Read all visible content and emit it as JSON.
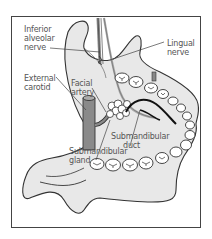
{
  "figure": {
    "labels": {
      "inferior_alveolar_nerve": [
        "Inferior",
        "alveolar",
        "nerve"
      ],
      "lingual_nerve": [
        "Lingual",
        "nerve"
      ],
      "external_carotid": [
        "External",
        "carotid"
      ],
      "facial_artery": [
        "Facial",
        "artery"
      ],
      "submandibular_duct": [
        "Submandibular",
        "duct"
      ],
      "submandibular_gland": [
        "Submandibular",
        "gland"
      ]
    },
    "colors": {
      "frame": "#444444",
      "bone_fill": "#e8e8e8",
      "outline": "#333333",
      "artery_fill": "#8a8a8a",
      "label_text": "#555555",
      "leader_line": "#444444"
    }
  }
}
